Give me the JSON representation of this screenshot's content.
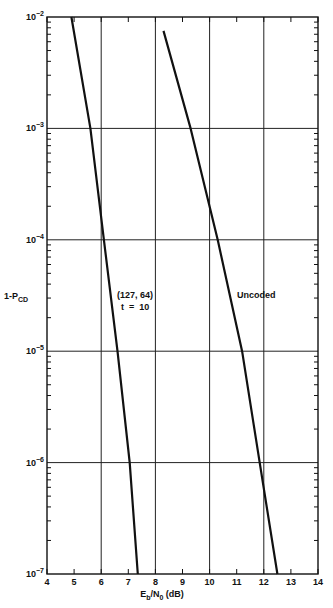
{
  "chart_data": {
    "type": "line",
    "title": "",
    "xlabel": "Eb/N0 (dB)",
    "xlabel_parts": {
      "main": "E",
      "sub1": "b",
      "mid": "/N",
      "sub2": "0",
      "tail": " (dB)"
    },
    "ylabel": "1-PCD",
    "ylabel_parts": {
      "main": "1-P",
      "sub": "CD"
    },
    "xlim": [
      4,
      14
    ],
    "ylim": [
      1e-07,
      0.01
    ],
    "yscale": "log",
    "x_ticks": [
      4,
      5,
      6,
      7,
      8,
      9,
      10,
      11,
      12,
      13,
      14
    ],
    "x_tick_labels": [
      "4",
      "5",
      "6",
      "7",
      "8",
      "9",
      "10",
      "11",
      "12",
      "13",
      "14"
    ],
    "x_grid": [
      6,
      8,
      10,
      12
    ],
    "y_decades": [
      -2,
      -3,
      -4,
      -5,
      -6,
      -7
    ],
    "y_tick_labels": [
      "10",
      "10",
      "10",
      "10",
      "10",
      "10"
    ],
    "y_tick_exponents": [
      "−2",
      "−3",
      "−4",
      "−5",
      "−6",
      "−7"
    ],
    "grid": true,
    "legend": null,
    "series": [
      {
        "name": "(127, 64) t = 10",
        "label_line1": "(127, 64)",
        "label_line2": "t  =  10",
        "x": [
          4.9,
          5.6,
          6.1,
          6.6,
          7.05,
          7.35
        ],
        "y": [
          0.01,
          0.001,
          0.0001,
          1e-05,
          1e-06,
          1e-07
        ]
      },
      {
        "name": "Uncoded",
        "label_line1": "Uncoded",
        "x": [
          8.3,
          9.3,
          10.3,
          11.2,
          11.85,
          12.5
        ],
        "y": [
          0.0075,
          0.001,
          0.0001,
          1e-05,
          1e-06,
          1e-07
        ]
      }
    ]
  },
  "colors": {
    "line": "#111111",
    "grid": "#222222",
    "background": "#ffffff"
  }
}
